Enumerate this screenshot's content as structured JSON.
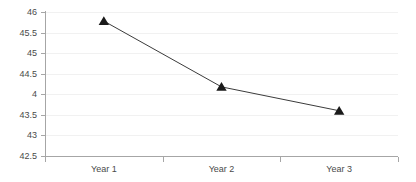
{
  "chart_data": {
    "type": "line",
    "title": "",
    "subtitle": "",
    "xlabel": "",
    "ylabel": "",
    "categories": [
      "Year 1",
      "Year 2",
      "Year 3"
    ],
    "values": [
      45.78,
      44.18,
      43.6
    ],
    "series": [
      {
        "name": "",
        "values": [
          45.78,
          44.18,
          43.6
        ]
      }
    ],
    "ylim": [
      42.5,
      46.0
    ],
    "ytick_values": [
      46,
      45.5,
      45,
      44.5,
      44,
      43.5,
      43,
      42.5
    ],
    "ytick_labels": [
      "46",
      "45.5",
      "45",
      "44.5",
      "4",
      "43.5",
      "43",
      "42.5"
    ],
    "grid": true,
    "grid_axis": "y",
    "legend": false,
    "legend_position": "none",
    "marker": "triangle",
    "annotations": []
  },
  "style": {
    "line_color": "#3b3b3b",
    "marker_color": "#1a1a1a",
    "axis_color": "#a6a6a6",
    "grid_color": "#f1f1f1",
    "label_color": "#4a4a4a",
    "background": "#ffffff"
  }
}
